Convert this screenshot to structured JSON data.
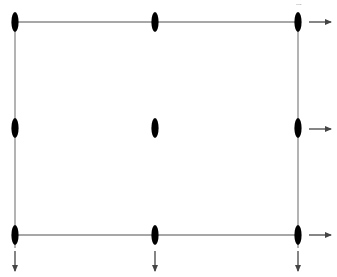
{
  "diagram": {
    "type": "grid-lattice",
    "colors": {
      "edge": "#8a8a8a",
      "node": "#000000",
      "arrow": "#444444"
    },
    "columns_x": [
      15,
      155,
      298
    ],
    "rows_y": [
      22,
      128,
      235
    ],
    "nodes": [
      {
        "id": "n-top-left",
        "row": 0,
        "col": 0
      },
      {
        "id": "n-top-middle",
        "row": 0,
        "col": 1
      },
      {
        "id": "n-top-right",
        "row": 0,
        "col": 2
      },
      {
        "id": "n-middle-left",
        "row": 1,
        "col": 0
      },
      {
        "id": "n-center",
        "row": 1,
        "col": 1
      },
      {
        "id": "n-middle-right",
        "row": 1,
        "col": 2
      },
      {
        "id": "n-bottom-left",
        "row": 2,
        "col": 0
      },
      {
        "id": "n-bottom-middle",
        "row": 2,
        "col": 1
      },
      {
        "id": "n-bottom-right",
        "row": 2,
        "col": 2
      }
    ],
    "edges": [
      {
        "id": "top-edge",
        "from": "n-top-left",
        "to": "n-top-right"
      },
      {
        "id": "bottom-edge",
        "from": "n-bottom-left",
        "to": "n-bottom-right"
      },
      {
        "id": "left-edge",
        "from": "n-top-left",
        "to": "n-bottom-left"
      },
      {
        "id": "right-edge",
        "from": "n-top-right",
        "to": "n-bottom-right"
      }
    ],
    "arrows_right": [
      "top",
      "middle",
      "bottom"
    ],
    "arrows_down": [
      "left",
      "middle",
      "right"
    ],
    "ellipsis_label": "..."
  }
}
